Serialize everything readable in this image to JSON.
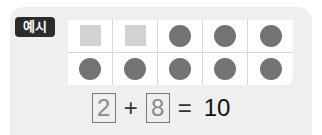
{
  "badge": {
    "label": "예시"
  },
  "grid": {
    "rows": 2,
    "cols": 5,
    "cells": [
      "square",
      "square",
      "dot",
      "dot",
      "dot",
      "dot",
      "dot",
      "dot",
      "dot",
      "dot"
    ],
    "colors": {
      "square": "#d2d2d2",
      "dot": "#737373"
    }
  },
  "equation": {
    "a": "2",
    "plus": "+",
    "b": "8",
    "equals": "=",
    "result": "10"
  }
}
